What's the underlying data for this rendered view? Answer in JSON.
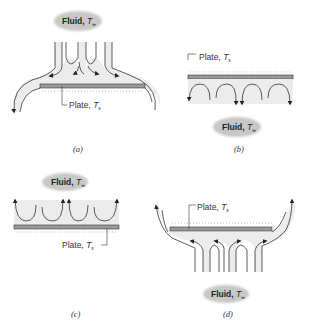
{
  "panels": [
    {
      "id": "a",
      "caption": "(a)",
      "fluid_label": "Fluid,",
      "fluid_symbol": "T",
      "fluid_sub": "∞",
      "plate_label": "Plate,",
      "plate_symbol": "T",
      "plate_sub": "s",
      "flow": "jets impinging downward on top of plate"
    },
    {
      "id": "b",
      "caption": "(b)",
      "fluid_label": "Fluid,",
      "fluid_symbol": "T",
      "fluid_sub": "∞",
      "plate_label": "Plate,",
      "plate_symbol": "T",
      "plate_sub": "s",
      "flow": "convection cells below plate, fluid below"
    },
    {
      "id": "c",
      "caption": "(c)",
      "fluid_label": "Fluid,",
      "fluid_symbol": "T",
      "fluid_sub": "∞",
      "plate_label": "Plate,",
      "plate_symbol": "T",
      "plate_sub": "s",
      "flow": "convection cells above plate, fluid above"
    },
    {
      "id": "d",
      "caption": "(d)",
      "fluid_label": "Fluid,",
      "fluid_symbol": "T",
      "fluid_sub": "∞",
      "plate_label": "Plate,",
      "plate_symbol": "T",
      "plate_sub": "s",
      "flow": "jets flowing upward onto bottom of plate"
    }
  ],
  "colors": {
    "flow_fill": "#ececec",
    "cloud": "#c8c8c8",
    "plate": "#9a9a9a",
    "stroke": "#333333"
  }
}
